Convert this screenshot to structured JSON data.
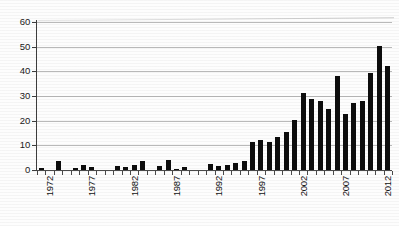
{
  "chart_data": {
    "type": "bar",
    "title": "",
    "subtitle": "",
    "xlabel": "",
    "ylabel": "",
    "xlim": [
      1972,
      2013
    ],
    "ylim": [
      0,
      60
    ],
    "grid": true,
    "legend": null,
    "legend_position": "none",
    "bar_color": "#0d0d0d",
    "grid_color": "#b9b9b9",
    "axis_color": "#3d3d3d",
    "y_ticks": [
      0,
      10,
      20,
      30,
      40,
      50,
      60
    ],
    "y_tick_labels": [
      "0",
      "10",
      "20",
      "30",
      "40",
      "50",
      "60"
    ],
    "x_tick_labels": [
      "1972",
      "1977",
      "1982",
      "1987",
      "1992",
      "1997",
      "2002",
      "2007",
      "2012"
    ],
    "x_tick_years": [
      1972,
      1977,
      1982,
      1987,
      1992,
      1997,
      2002,
      2007,
      2012
    ],
    "categories": [
      "1972",
      "1973",
      "1974",
      "1975",
      "1976",
      "1977",
      "1978",
      "1979",
      "1980",
      "1981",
      "1982",
      "1983",
      "1984",
      "1985",
      "1986",
      "1987",
      "1988",
      "1989",
      "1990",
      "1991",
      "1992",
      "1993",
      "1994",
      "1995",
      "1996",
      "1997",
      "1998",
      "1999",
      "2000",
      "2001",
      "2002",
      "2003",
      "2004",
      "2005",
      "2006",
      "2007",
      "2008",
      "2009",
      "2010",
      "2011",
      "2012",
      "2013"
    ],
    "values": [
      1,
      0,
      3.5,
      0,
      1,
      2,
      1.2,
      0,
      0,
      1.5,
      1.2,
      2,
      3.5,
      0,
      1.5,
      4.2,
      0.3,
      1.4,
      0,
      0,
      2.3,
      1.8,
      2,
      3,
      3.8,
      11.2,
      12.1,
      11.3,
      13.3,
      15.4,
      20.4,
      31.4,
      28.9,
      27.8,
      24.6,
      38.1,
      22.6,
      27.1,
      28,
      39.4,
      50.3,
      42.1
    ]
  }
}
